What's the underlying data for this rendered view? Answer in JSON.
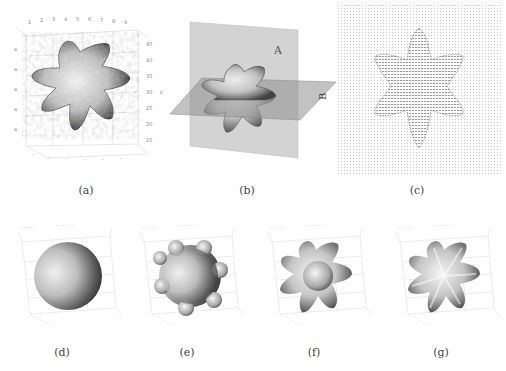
{
  "figure": {
    "panels": [
      {
        "id": "a",
        "caption": "(a)",
        "kind": "3d-isosurface",
        "shape": "six-armed star (noisy)",
        "z_ticks": [
          "45",
          "40",
          "35",
          "30",
          "25",
          "20",
          "15"
        ],
        "z_label": "z"
      },
      {
        "id": "b",
        "caption": "(b)",
        "kind": "3d-isosurface-with-slicing-planes",
        "shape": "six-armed star",
        "plane_labels": [
          "A",
          "B"
        ]
      },
      {
        "id": "c",
        "caption": "(c)",
        "kind": "2d-vector-field",
        "shape": "six-armed star outline"
      },
      {
        "id": "d",
        "caption": "(d)",
        "kind": "3d-isosurface",
        "shape": "sphere"
      },
      {
        "id": "e",
        "caption": "(e)",
        "kind": "3d-isosurface",
        "shape": "sphere with bumps"
      },
      {
        "id": "f",
        "caption": "(f)",
        "kind": "3d-isosurface",
        "shape": "six-armed star with central sphere"
      },
      {
        "id": "g",
        "caption": "(g)",
        "kind": "3d-isosurface",
        "shape": "six-armed star (smooth)"
      }
    ],
    "colors": {
      "surface_light": "#f2f2f2",
      "surface_dark": "#3a3a3a",
      "plane_A": "#c8c8c8",
      "plane_B": "#9a9a9a",
      "grid": "#d6d6d6",
      "vector": "#9a9a9a"
    }
  }
}
